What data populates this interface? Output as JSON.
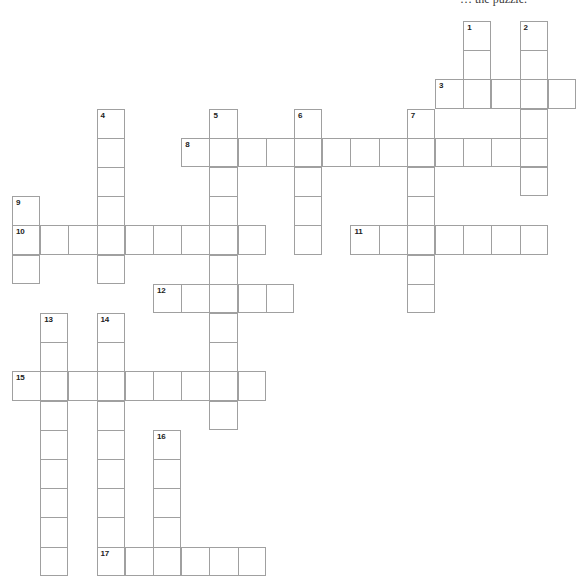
{
  "page": {
    "caption": {
      "visible_text": "… the puzzle."
    }
  },
  "crossword": {
    "grid": {
      "origin_x": 12,
      "origin_y": 21,
      "cell_width": 28.2,
      "cell_height": 29.2,
      "line_color": "#a0a0a0",
      "number_color": "#222222",
      "background_color": "#ffffff"
    },
    "entries": [
      {
        "number": 1,
        "direction": "down",
        "col": 16,
        "row": 0,
        "length": 3
      },
      {
        "number": 2,
        "direction": "down",
        "col": 18,
        "row": 0,
        "length": 6
      },
      {
        "number": 3,
        "direction": "across",
        "col": 15,
        "row": 2,
        "length": 5
      },
      {
        "number": 4,
        "direction": "down",
        "col": 3,
        "row": 3,
        "length": 6
      },
      {
        "number": 5,
        "direction": "down",
        "col": 7,
        "row": 3,
        "length": 11
      },
      {
        "number": 6,
        "direction": "down",
        "col": 10,
        "row": 3,
        "length": 5
      },
      {
        "number": 7,
        "direction": "down",
        "col": 14,
        "row": 3,
        "length": 7
      },
      {
        "number": 8,
        "direction": "across",
        "col": 6,
        "row": 4,
        "length": 13
      },
      {
        "number": 9,
        "direction": "down",
        "col": 0,
        "row": 6,
        "length": 3
      },
      {
        "number": 10,
        "direction": "across",
        "col": 0,
        "row": 7,
        "length": 9
      },
      {
        "number": 11,
        "direction": "across",
        "col": 12,
        "row": 7,
        "length": 7
      },
      {
        "number": 12,
        "direction": "across",
        "col": 5,
        "row": 9,
        "length": 5
      },
      {
        "number": 13,
        "direction": "down",
        "col": 1,
        "row": 10,
        "length": 9
      },
      {
        "number": 14,
        "direction": "down",
        "col": 3,
        "row": 10,
        "length": 9
      },
      {
        "number": 15,
        "direction": "across",
        "col": 0,
        "row": 12,
        "length": 9
      },
      {
        "number": 16,
        "direction": "down",
        "col": 5,
        "row": 14,
        "length": 5
      },
      {
        "number": 17,
        "direction": "across",
        "col": 3,
        "row": 18,
        "length": 6
      }
    ]
  }
}
